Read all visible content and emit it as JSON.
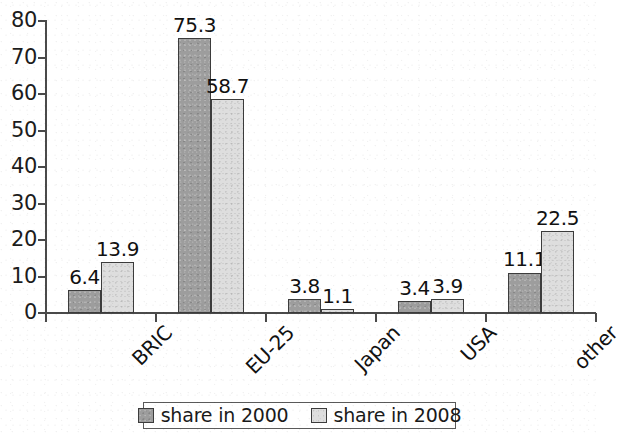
{
  "chart_data": {
    "type": "bar",
    "title": "",
    "subtitle": "",
    "xlabel": "",
    "ylabel": "",
    "categories": [
      "BRIC",
      "EU-25",
      "Japan",
      "USA",
      "other"
    ],
    "series": [
      {
        "name": "share in 2000",
        "color": "#9d9d9d",
        "values": [
          6.4,
          13.9,
          75.3,
          58.7,
          3.8
        ]
      }
    ],
    "grouped_series": [
      {
        "name": "share in 2000",
        "color": "#9d9d9d",
        "values": [
          6.4,
          75.3,
          3.8,
          3.4,
          11.1
        ]
      },
      {
        "name": "share in 2008",
        "color": "#dedede",
        "values": [
          13.9,
          58.7,
          1.1,
          3.9,
          22.5
        ]
      }
    ],
    "value_labels": [
      [
        "6.4",
        "13.9"
      ],
      [
        "75.3",
        "58.7"
      ],
      [
        "3.8",
        "1.1"
      ],
      [
        "3.4",
        "3.9"
      ],
      [
        "11.1",
        "22.5"
      ]
    ],
    "ylim": [
      0,
      80
    ],
    "ytick_values": [
      0,
      10,
      20,
      30,
      40,
      50,
      60,
      70,
      80
    ],
    "ytick_labels": [
      "0",
      "10",
      "20",
      "30",
      "40",
      "50",
      "60",
      "70",
      "80"
    ],
    "grid": false,
    "legend_position": "bottom-center",
    "axis_color": "#4a4a4a",
    "bar_border_color": "#3c3c3c",
    "category_label_rotation_deg": -45
  },
  "legend": {
    "items": [
      {
        "label": "share in 2000",
        "swatch": "legend-swatch-2000"
      },
      {
        "label": "share in 2008",
        "swatch": "legend-swatch-2008"
      }
    ]
  }
}
